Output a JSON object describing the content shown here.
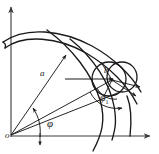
{
  "figure": {
    "kind": "technical-line-drawing",
    "background_color": "#ffffff",
    "ink_color": "#1a1a1a",
    "axis_color": "#3a3a3a",
    "labels": {
      "origin": "o",
      "radius_a": "a",
      "radius_b": "b",
      "angle_phi": "φ",
      "angle_phi1_base": "φ",
      "angle_phi1_sub": "1"
    },
    "elements": [
      {
        "name": "y-axis",
        "description": "vertical axis with upward arrowhead"
      },
      {
        "name": "x-axis",
        "description": "horizontal axis with rightward arrowhead"
      },
      {
        "name": "outer-blade-curve",
        "description": "long arc sweeping from upper-left down to lower-right"
      },
      {
        "name": "inner-blade-curve",
        "description": "second long arc parallel below the first"
      },
      {
        "name": "descending-curve",
        "description": "steep curve crossing the x-axis near the circles"
      },
      {
        "name": "circle-left",
        "description": "circle centered near point b"
      },
      {
        "name": "circle-right",
        "description": "overlapping circle shifted to the right"
      },
      {
        "name": "ray-a",
        "description": "radius vector from origin labelled a with arrowhead at curve"
      },
      {
        "name": "ray-b",
        "description": "radius vector from origin to point b"
      },
      {
        "name": "horizontal-chord",
        "description": "horizontal line ending at point b with arrowhead"
      },
      {
        "name": "angle-arc-phi",
        "description": "arc marking angle phi at the origin"
      },
      {
        "name": "angle-arc-phi1",
        "description": "arc marking angle phi-one at point b"
      }
    ]
  }
}
